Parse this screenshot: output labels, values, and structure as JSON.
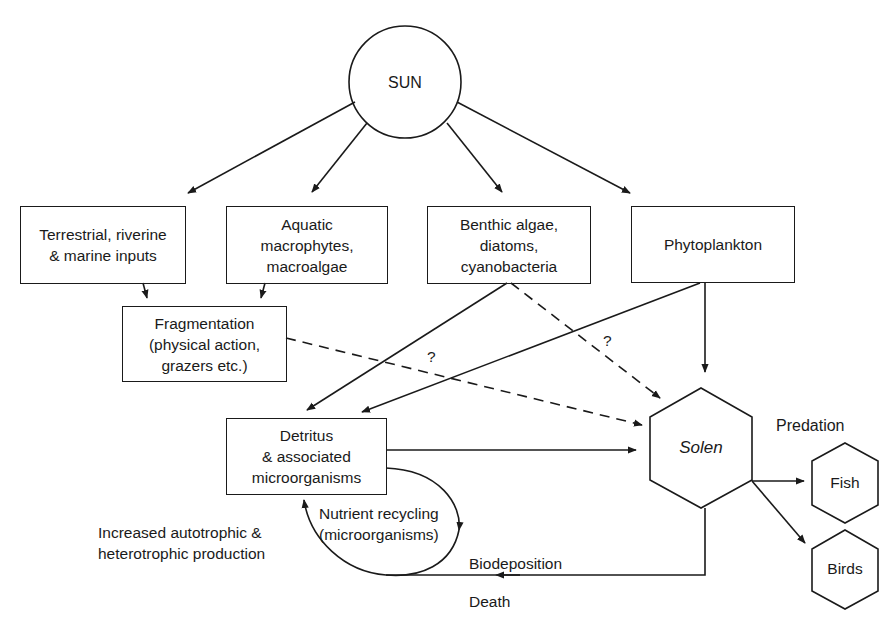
{
  "diagram": {
    "sun": "SUN",
    "boxes": {
      "terrestrial": "Terrestrial, riverine\n& marine inputs",
      "aquatic": "Aquatic\nmacrophytes,\nmacroalgae",
      "benthic": "Benthic algae,\ndiatoms,\ncyanobacteria",
      "phytoplankton": "Phytoplankton",
      "fragmentation": "Fragmentation\n(physical action,\ngrazers etc.)",
      "detritus": "Detritus\n& associated\nmicroorganisms"
    },
    "hexagons": {
      "solen": "Solen",
      "fish": "Fish",
      "birds": "Birds"
    },
    "labels": {
      "predation": "Predation",
      "question_1": "?",
      "question_2": "?",
      "nutrient_recycling": "Nutrient recycling\n(microorganisms)",
      "increased_production": "Increased autotrophic &\nheterotrophic production",
      "biodeposition": "Biodeposition",
      "death": "Death"
    },
    "colors": {
      "stroke": "#1a1a1a",
      "background": "#ffffff"
    }
  }
}
